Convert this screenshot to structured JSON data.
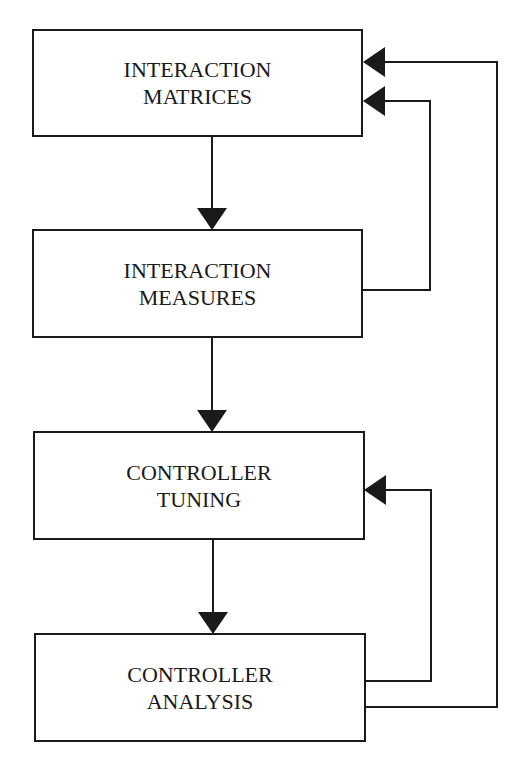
{
  "diagram": {
    "type": "flowchart",
    "nodes": [
      {
        "id": "interaction-matrices",
        "lines": [
          "INTERACTION",
          "MATRICES"
        ]
      },
      {
        "id": "interaction-measures",
        "lines": [
          "INTERACTION",
          "MEASURES"
        ]
      },
      {
        "id": "controller-tuning",
        "lines": [
          "CONTROLLER",
          "TUNING"
        ]
      },
      {
        "id": "controller-analysis",
        "lines": [
          "CONTROLLER",
          "ANALYSIS"
        ]
      }
    ],
    "edges": [
      {
        "from": "interaction-matrices",
        "to": "interaction-measures",
        "kind": "forward"
      },
      {
        "from": "interaction-measures",
        "to": "controller-tuning",
        "kind": "forward"
      },
      {
        "from": "controller-tuning",
        "to": "controller-analysis",
        "kind": "forward"
      },
      {
        "from": "interaction-measures",
        "to": "interaction-matrices",
        "kind": "feedback"
      },
      {
        "from": "controller-analysis",
        "to": "controller-tuning",
        "kind": "feedback"
      },
      {
        "from": "controller-analysis",
        "to": "interaction-matrices",
        "kind": "feedback"
      }
    ],
    "colors": {
      "line": "#1a1a1a",
      "background": "#ffffff"
    }
  }
}
